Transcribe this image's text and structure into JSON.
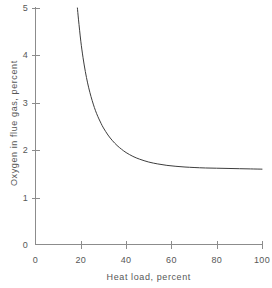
{
  "chart_data": {
    "type": "line",
    "title": "",
    "subtitle": "",
    "xlabel": "Heat load, percent",
    "ylabel": "Oxygen in flue gas, percent",
    "xlim": [
      0,
      100
    ],
    "ylim": [
      0,
      5
    ],
    "xticks": [
      0,
      20,
      40,
      60,
      80,
      100
    ],
    "yticks": [
      0,
      1,
      2,
      3,
      4,
      5
    ],
    "xtick_labels": [
      "0",
      "20",
      "40",
      "60",
      "80",
      "100"
    ],
    "ytick_labels": [
      "0",
      "1",
      "2",
      "3",
      "4",
      "5"
    ],
    "grid": false,
    "legend": null,
    "legend_position": "none",
    "annotations": [],
    "series": [
      {
        "name": "Oxygen in flue gas",
        "color": "#3d3d3d",
        "line_width": 1,
        "asymptote": 1.6,
        "x": [
          18.5,
          19,
          20,
          21,
          22,
          23,
          24,
          25,
          26,
          27,
          28,
          29,
          30,
          32,
          34,
          36,
          38,
          40,
          43,
          46,
          50,
          54,
          58,
          62,
          66,
          70,
          75,
          80,
          85,
          90,
          95,
          100
        ],
        "y": [
          5.0,
          4.75,
          4.3,
          3.95,
          3.66,
          3.42,
          3.22,
          3.05,
          2.9,
          2.77,
          2.66,
          2.56,
          2.47,
          2.32,
          2.2,
          2.1,
          2.02,
          1.95,
          1.87,
          1.81,
          1.75,
          1.71,
          1.68,
          1.66,
          1.645,
          1.635,
          1.625,
          1.62,
          1.615,
          1.61,
          1.605,
          1.6
        ]
      }
    ]
  },
  "axes": {
    "x_tick_mark_length": 4,
    "y_tick_mark_length": 4,
    "axis_color": "#8c8c8c",
    "curve_color": "#3d3d3d"
  }
}
